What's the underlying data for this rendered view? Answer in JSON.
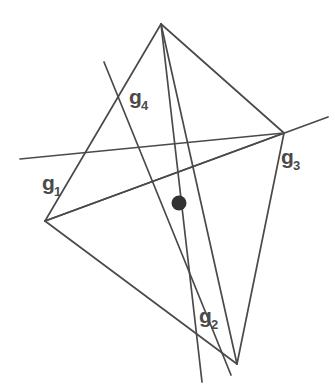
{
  "figure": {
    "name": "tetrahedron-four-concurrent-lines",
    "caption": "",
    "background_color": "#ffffff",
    "stroke_color": "#4a4a4a",
    "stroke_width": 1.7,
    "label_color": "#4a4a4a",
    "point_color": "#333333",
    "width": 335,
    "height": 389
  },
  "labels": {
    "g1": {
      "base": "g",
      "sub": "1",
      "x": 42,
      "y": 190
    },
    "g2": {
      "base": "g",
      "sub": "2",
      "x": 199,
      "y": 323
    },
    "g3": {
      "base": "g",
      "sub": "3",
      "x": 281,
      "y": 164
    },
    "g4": {
      "base": "g",
      "sub": "4",
      "x": 129,
      "y": 104
    }
  },
  "geometry": {
    "vertices": {
      "top": {
        "x": 161,
        "y": 24
      },
      "left": {
        "x": 45,
        "y": 221
      },
      "right": {
        "x": 284,
        "y": 133
      },
      "bottom": {
        "x": 237,
        "y": 364
      }
    },
    "intersection_point": {
      "x": 179,
      "y": 203,
      "r": 7.5
    },
    "edges": [
      {
        "name": "edge-top-left",
        "d": "M 161 24 L 45 221"
      },
      {
        "name": "edge-top-right",
        "d": "M 161 24 L 284 133"
      },
      {
        "name": "edge-top-bottom",
        "d": "M 161 24 L 237 364"
      },
      {
        "name": "edge-left-right",
        "d": "M 45 221 L 284 133"
      },
      {
        "name": "edge-left-bottom",
        "d": "M 45 221 L 237 364"
      },
      {
        "name": "edge-right-bottom",
        "d": "M 284 133 L 237 364"
      }
    ],
    "lines": [
      {
        "name": "g1-line",
        "d": "M 20 159 L 284 133"
      },
      {
        "name": "g2-line",
        "d": "M 161 24 L 202 382"
      },
      {
        "name": "g3-line",
        "d": "M 45 221 L 328 117"
      },
      {
        "name": "g4-line",
        "d": "M 104 62 L 231 375"
      }
    ]
  }
}
